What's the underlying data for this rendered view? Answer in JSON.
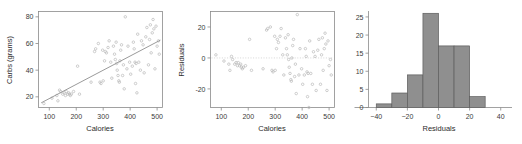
{
  "figure": {
    "title": "",
    "panel_count": 3
  },
  "chart_data": [
    {
      "type": "scatter",
      "title": "",
      "xlabel": "Calories",
      "ylabel": "Carbs (grams)",
      "xlim": [
        60,
        520
      ],
      "ylim": [
        12,
        84
      ],
      "xticks": [
        100,
        200,
        300,
        400,
        500
      ],
      "yticks": [
        20,
        40,
        60,
        80
      ],
      "grid": false,
      "frame": "box",
      "legend": "none",
      "annotations": [
        "least-squares regression line"
      ],
      "trendline": {
        "x": [
          70,
          512
        ],
        "y": [
          15.5,
          62.5
        ]
      },
      "points": [
        [
          80,
          15
        ],
        [
          110,
          19
        ],
        [
          128,
          21
        ],
        [
          132,
          17
        ],
        [
          138,
          25
        ],
        [
          142,
          24
        ],
        [
          150,
          22
        ],
        [
          155,
          23
        ],
        [
          160,
          21
        ],
        [
          163,
          24
        ],
        [
          168,
          22
        ],
        [
          172,
          23
        ],
        [
          175,
          22
        ],
        [
          178,
          21
        ],
        [
          182,
          22
        ],
        [
          190,
          24
        ],
        [
          205,
          43
        ],
        [
          212,
          22
        ],
        [
          255,
          31
        ],
        [
          268,
          54
        ],
        [
          272,
          56
        ],
        [
          282,
          60
        ],
        [
          288,
          31
        ],
        [
          292,
          30
        ],
        [
          298,
          55
        ],
        [
          300,
          32
        ],
        [
          305,
          47
        ],
        [
          308,
          54
        ],
        [
          312,
          53
        ],
        [
          318,
          57
        ],
        [
          322,
          62
        ],
        [
          328,
          46
        ],
        [
          332,
          34
        ],
        [
          338,
          58
        ],
        [
          342,
          52
        ],
        [
          345,
          48
        ],
        [
          348,
          61
        ],
        [
          350,
          45
        ],
        [
          352,
          40
        ],
        [
          355,
          36
        ],
        [
          358,
          32
        ],
        [
          360,
          31
        ],
        [
          362,
          47
        ],
        [
          365,
          55
        ],
        [
          368,
          59
        ],
        [
          372,
          36
        ],
        [
          375,
          44
        ],
        [
          378,
          26
        ],
        [
          382,
          80
        ],
        [
          388,
          41
        ],
        [
          392,
          58
        ],
        [
          398,
          46
        ],
        [
          402,
          37
        ],
        [
          408,
          43
        ],
        [
          412,
          61
        ],
        [
          415,
          56
        ],
        [
          418,
          46
        ],
        [
          420,
          30
        ],
        [
          422,
          45
        ],
        [
          425,
          23
        ],
        [
          428,
          67
        ],
        [
          432,
          46
        ],
        [
          438,
          40
        ],
        [
          442,
          62
        ],
        [
          448,
          59
        ],
        [
          452,
          38
        ],
        [
          458,
          65
        ],
        [
          462,
          72
        ],
        [
          468,
          44
        ],
        [
          472,
          63
        ],
        [
          475,
          74
        ],
        [
          478,
          53
        ],
        [
          482,
          68
        ],
        [
          485,
          78
        ],
        [
          488,
          71
        ],
        [
          492,
          41
        ],
        [
          496,
          73
        ],
        [
          500,
          58
        ],
        [
          505,
          62
        ],
        [
          508,
          52
        ]
      ]
    },
    {
      "type": "scatter",
      "title": "",
      "xlabel": "Calories",
      "ylabel": "Residuals",
      "xlim": [
        60,
        520
      ],
      "ylim": [
        -32,
        30
      ],
      "xticks": [
        100,
        200,
        300,
        400,
        500
      ],
      "yticks": [
        -20,
        0,
        20
      ],
      "grid": false,
      "frame": "box",
      "legend": "none",
      "annotations": [
        "dotted horizontal reference line at y = 0"
      ],
      "refline_y": 0,
      "points": [
        [
          80,
          2
        ],
        [
          110,
          -2
        ],
        [
          128,
          -4
        ],
        [
          132,
          -8
        ],
        [
          138,
          1
        ],
        [
          142,
          -1
        ],
        [
          150,
          -4
        ],
        [
          155,
          -3
        ],
        [
          160,
          -5
        ],
        [
          163,
          -3
        ],
        [
          168,
          -5
        ],
        [
          172,
          -4
        ],
        [
          175,
          -6
        ],
        [
          178,
          -7
        ],
        [
          182,
          -6
        ],
        [
          190,
          -5
        ],
        [
          205,
          12
        ],
        [
          212,
          -8
        ],
        [
          255,
          -7
        ],
        [
          268,
          18
        ],
        [
          272,
          19
        ],
        [
          282,
          20
        ],
        [
          288,
          -8
        ],
        [
          292,
          -9
        ],
        [
          298,
          14
        ],
        [
          300,
          -8
        ],
        [
          305,
          6
        ],
        [
          308,
          12
        ],
        [
          312,
          10
        ],
        [
          318,
          14
        ],
        [
          322,
          19
        ],
        [
          328,
          2
        ],
        [
          332,
          -11
        ],
        [
          338,
          13
        ],
        [
          342,
          6
        ],
        [
          345,
          2
        ],
        [
          348,
          15
        ],
        [
          350,
          -1
        ],
        [
          352,
          -6
        ],
        [
          355,
          -10
        ],
        [
          358,
          -14
        ],
        [
          360,
          -15
        ],
        [
          362,
          0
        ],
        [
          365,
          8
        ],
        [
          368,
          12
        ],
        [
          372,
          -12
        ],
        [
          375,
          -4
        ],
        [
          378,
          -23
        ],
        [
          382,
          28
        ],
        [
          388,
          -11
        ],
        [
          392,
          6
        ],
        [
          398,
          -7
        ],
        [
          402,
          -17
        ],
        [
          408,
          -11
        ],
        [
          412,
          6
        ],
        [
          415,
          1
        ],
        [
          418,
          -9
        ],
        [
          420,
          -25
        ],
        [
          422,
          -10
        ],
        [
          425,
          -32
        ],
        [
          428,
          11
        ],
        [
          432,
          -10
        ],
        [
          438,
          -17
        ],
        [
          442,
          4
        ],
        [
          448,
          1
        ],
        [
          452,
          -21
        ],
        [
          458,
          5
        ],
        [
          462,
          12
        ],
        [
          468,
          -17
        ],
        [
          472,
          2
        ],
        [
          475,
          13
        ],
        [
          478,
          -8
        ],
        [
          482,
          6
        ],
        [
          485,
          16
        ],
        [
          488,
          9
        ],
        [
          492,
          -21
        ],
        [
          496,
          11
        ],
        [
          500,
          -5
        ],
        [
          505,
          -1
        ],
        [
          508,
          -11
        ]
      ]
    },
    {
      "type": "bar",
      "subtype": "histogram",
      "title": "",
      "xlabel": "Residuals",
      "ylabel": "",
      "xlim": [
        -45,
        45
      ],
      "ylim": [
        0,
        26.5
      ],
      "xticks": [
        -40,
        -20,
        0,
        20,
        40
      ],
      "yticks": [
        0,
        5,
        10,
        15,
        20,
        25
      ],
      "grid": false,
      "frame": "left-bottom",
      "legend": "none",
      "bin_width": 10,
      "bin_edges": [
        -40,
        -30,
        -20,
        -10,
        0,
        10,
        20,
        30
      ],
      "categories": [
        "-40 to -30",
        "-30 to -20",
        "-20 to -10",
        "-10 to 0",
        "0 to 10",
        "10 to 20",
        "20 to 30"
      ],
      "values": [
        1,
        4,
        9,
        26,
        17,
        17,
        3
      ],
      "bar_color": "#8f8f8f",
      "bar_edge_color": "#5d5d5d"
    }
  ]
}
